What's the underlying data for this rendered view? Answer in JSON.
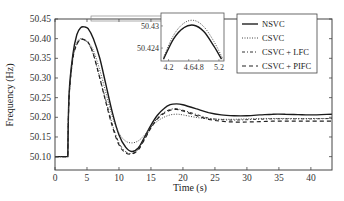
{
  "chart_data": {
    "type": "line",
    "title": "",
    "xlabel": "Time (s)",
    "ylabel": "Frequency (Hz)",
    "xlim": [
      0,
      43.3
    ],
    "ylim": [
      50.066,
      50.45
    ],
    "xticks": [
      0,
      5,
      10,
      15,
      20,
      25,
      30,
      35,
      40
    ],
    "yticks": [
      50.1,
      50.15,
      50.2,
      50.25,
      50.3,
      50.35,
      50.4,
      50.45
    ],
    "ytick_labels": [
      "50.10",
      "50.15",
      "50.20",
      "50.25",
      "50.30",
      "50.35",
      "50.40",
      "50.45"
    ],
    "grid": false,
    "legend_position": "upper right",
    "series": [
      {
        "name": "NSVC",
        "style": "solid",
        "x": [
          0,
          2,
          2.2,
          2.8,
          3.4,
          4.0,
          4.6,
          5.2,
          6,
          7,
          8,
          9,
          10,
          11,
          12,
          13,
          14,
          15,
          16,
          17,
          18,
          19,
          20,
          22,
          24,
          26,
          28,
          30,
          32,
          34,
          36,
          38,
          40,
          43.3
        ],
        "y": [
          50.1,
          50.1,
          50.26,
          50.36,
          50.41,
          50.428,
          50.43,
          50.425,
          50.4,
          50.35,
          50.28,
          50.21,
          50.155,
          50.125,
          50.113,
          50.122,
          50.15,
          50.18,
          50.205,
          50.222,
          50.232,
          50.234,
          50.232,
          50.222,
          50.212,
          50.206,
          50.204,
          50.204,
          50.206,
          50.208,
          50.208,
          50.207,
          50.206,
          50.208
        ]
      },
      {
        "name": "CSVC",
        "style": "dotted",
        "x": [
          0,
          2,
          2.2,
          2.8,
          3.4,
          4.0,
          4.6,
          5.2,
          6,
          7,
          8,
          9,
          10,
          11,
          12,
          13,
          14,
          15,
          16,
          17,
          18,
          19,
          20,
          22,
          24,
          26,
          28,
          30,
          32,
          34,
          36,
          38,
          40,
          43.3
        ],
        "y": [
          50.1,
          50.1,
          50.25,
          50.35,
          50.39,
          50.4,
          50.398,
          50.39,
          50.37,
          50.32,
          50.26,
          50.2,
          50.16,
          50.14,
          50.135,
          50.14,
          50.155,
          50.175,
          50.19,
          50.2,
          50.206,
          50.208,
          50.206,
          50.2,
          50.196,
          50.195,
          50.195,
          50.196,
          50.197,
          50.197,
          50.197,
          50.197,
          50.197,
          50.197
        ]
      },
      {
        "name": "CSVC + LFC",
        "style": "dashdot",
        "x": [
          0,
          2,
          2.2,
          2.8,
          3.4,
          4.0,
          4.6,
          5.2,
          6,
          7,
          8,
          9,
          10,
          11,
          12,
          13,
          14,
          15,
          16,
          17,
          18,
          19,
          20,
          22,
          24,
          26,
          28,
          30,
          32,
          34,
          36,
          38,
          40,
          43.3
        ],
        "y": [
          50.1,
          50.1,
          50.25,
          50.35,
          50.385,
          50.398,
          50.396,
          50.388,
          50.36,
          50.3,
          50.24,
          50.18,
          50.135,
          50.113,
          50.108,
          50.118,
          50.145,
          50.175,
          50.198,
          50.212,
          50.22,
          50.222,
          50.218,
          50.208,
          50.198,
          50.194,
          50.193,
          50.194,
          50.195,
          50.196,
          50.196,
          50.196,
          50.196,
          50.197
        ]
      },
      {
        "name": "CSVC + PIFC",
        "style": "dashed",
        "x": [
          0,
          2,
          2.2,
          2.8,
          3.4,
          4.0,
          4.6,
          5.2,
          6,
          7,
          8,
          9,
          10,
          11,
          12,
          13,
          14,
          15,
          16,
          17,
          18,
          19,
          20,
          22,
          24,
          26,
          28,
          30,
          32,
          34,
          36,
          38,
          40,
          43.3
        ],
        "y": [
          50.1,
          50.1,
          50.25,
          50.35,
          50.385,
          50.398,
          50.397,
          50.39,
          50.36,
          50.3,
          50.235,
          50.175,
          50.13,
          50.11,
          50.107,
          50.117,
          50.144,
          50.173,
          50.196,
          50.21,
          50.218,
          50.22,
          50.216,
          50.205,
          50.195,
          50.19,
          50.188,
          50.188,
          50.189,
          50.19,
          50.19,
          50.19,
          50.19,
          50.19
        ]
      }
    ],
    "inset": {
      "xlim": [
        4.05,
        5.3
      ],
      "ylim": [
        50.4205,
        50.4335
      ],
      "xticks": [
        4.2,
        4.6,
        4.8,
        5.2
      ],
      "xtick_labels": [
        "4.2",
        "4.6",
        "4.8",
        "5.2"
      ],
      "yticks": [
        50.424,
        50.43
      ],
      "ytick_labels": [
        "50.424",
        "50.43"
      ],
      "series": [
        {
          "name": "NSVC",
          "style": "solid",
          "x": [
            4.1,
            4.3,
            4.5,
            4.7,
            4.9,
            5.1,
            5.25
          ],
          "y": [
            50.421,
            50.4265,
            50.4295,
            50.4302,
            50.4285,
            50.4245,
            50.421
          ]
        },
        {
          "name": "CSVC",
          "style": "dotted",
          "x": [
            4.1,
            4.3,
            4.5,
            4.7,
            4.9,
            5.1,
            5.28
          ],
          "y": [
            50.4215,
            50.4275,
            50.4307,
            50.4315,
            50.4298,
            50.4258,
            50.421
          ]
        }
      ]
    }
  },
  "labels": {
    "ylabel": "Frequency (Hz)",
    "xlabel": "Time (s)",
    "legend": [
      "NSVC",
      "CSVC",
      "CSVC + LFC",
      "CSVC + PIFC"
    ]
  }
}
